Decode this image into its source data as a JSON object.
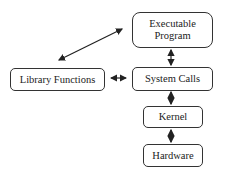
{
  "diagram": {
    "nodes": [
      {
        "id": "executable",
        "label_line1": "Executable",
        "label_line2": "Program"
      },
      {
        "id": "system_calls",
        "label": "System Calls"
      },
      {
        "id": "library",
        "label": "Library Functions"
      },
      {
        "id": "kernel",
        "label": "Kernel"
      },
      {
        "id": "hardware",
        "label": "Hardware"
      }
    ],
    "edges": [
      {
        "from": "executable",
        "to": "library",
        "type": "bidirectional"
      },
      {
        "from": "executable",
        "to": "system_calls",
        "type": "bidirectional"
      },
      {
        "from": "library",
        "to": "system_calls",
        "type": "bidirectional"
      },
      {
        "from": "system_calls",
        "to": "kernel",
        "type": "bidirectional"
      },
      {
        "from": "kernel",
        "to": "hardware",
        "type": "bidirectional"
      }
    ],
    "colors": {
      "stroke": "#333333",
      "background": "#ffffff"
    }
  }
}
